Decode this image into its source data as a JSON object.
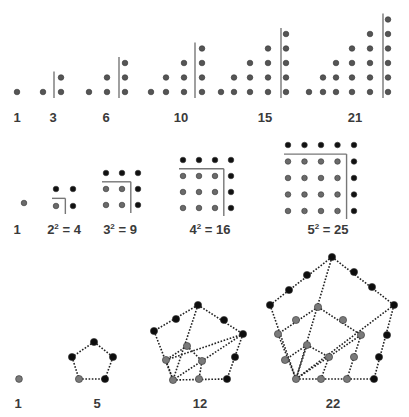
{
  "colors": {
    "gray_dot": "#6e6e6e",
    "black_dot": "#111111",
    "line": "#777777",
    "text": "#3a3a3a"
  },
  "rows": [
    {
      "name": "triangular",
      "labels": [
        {
          "text": "1",
          "x": 17,
          "y": 110
        },
        {
          "text": "3",
          "x": 53,
          "y": 110
        },
        {
          "text": "6",
          "x": 106,
          "y": 110
        },
        {
          "text": "10",
          "x": 181,
          "y": 110
        },
        {
          "text": "15",
          "x": 265,
          "y": 110
        },
        {
          "text": "21",
          "x": 355,
          "y": 110
        }
      ]
    },
    {
      "name": "square",
      "labels": [
        {
          "base": "1",
          "exp": "",
          "eq": "",
          "x": 17,
          "y": 225
        },
        {
          "base": "2",
          "exp": "2",
          "eq": " = 4",
          "x": 64,
          "y": 225
        },
        {
          "base": "3",
          "exp": "2",
          "eq": " = 9",
          "x": 120,
          "y": 225
        },
        {
          "base": "4",
          "exp": "2",
          "eq": " = 16",
          "x": 210,
          "y": 225
        },
        {
          "base": "5",
          "exp": "2",
          "eq": " = 25",
          "x": 328,
          "y": 225
        }
      ]
    },
    {
      "name": "pentagonal",
      "labels": [
        {
          "text": "1",
          "x": 18,
          "y": 396
        },
        {
          "text": "5",
          "x": 97,
          "y": 396
        },
        {
          "text": "12",
          "x": 200,
          "y": 396
        },
        {
          "text": "22",
          "x": 333,
          "y": 396
        }
      ]
    }
  ]
}
